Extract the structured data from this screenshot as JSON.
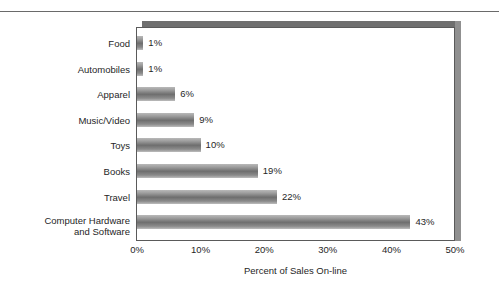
{
  "chart_data": {
    "type": "bar",
    "orientation": "horizontal",
    "title": "",
    "xlabel": "Percent of Sales On-line",
    "ylabel": "",
    "xlim": [
      0,
      50
    ],
    "grid": false,
    "legend": false,
    "unit": "%",
    "categories": [
      "Food",
      "Automobiles",
      "Apparel",
      "Music/Video",
      "Toys",
      "Books",
      "Travel",
      "Computer Hardware\nand Software"
    ],
    "values": [
      1,
      1,
      6,
      9,
      10,
      19,
      22,
      43
    ],
    "data_labels": [
      "1%",
      "1%",
      "6%",
      "9%",
      "10%",
      "19%",
      "22%",
      "43%"
    ],
    "xticks": [
      0,
      10,
      20,
      30,
      40,
      50
    ],
    "xtick_labels": [
      "0%",
      "10%",
      "20%",
      "30%",
      "40%",
      "50%"
    ]
  },
  "style": {
    "bar_light": "#b9b9b9",
    "bar_dark": "#6e6e6e",
    "frame_color": "#5a5a5a",
    "shadow_color": "#6f6f6f",
    "text_color": "#262626",
    "background": "#ffffff"
  }
}
